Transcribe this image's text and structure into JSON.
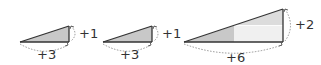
{
  "diagram": {
    "colors": {
      "line": "#333333",
      "fill_dark": "#c8c8c8",
      "fill_light": "#e4e4e4",
      "fill_lighter": "#f2f2f2",
      "dotted": "#888888"
    },
    "triangles": [
      {
        "run_label": "+3",
        "rise_label": "+1"
      },
      {
        "run_label": "+3",
        "rise_label": "+1"
      },
      {
        "run_label": "+6",
        "rise_label": "+2"
      }
    ]
  }
}
